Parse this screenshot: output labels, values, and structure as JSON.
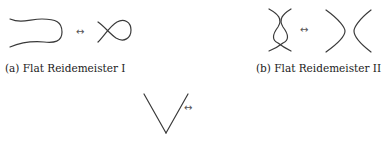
{
  "figure": {
    "moves": [
      {
        "id": "a",
        "caption": "(a) Flat Reidemeister I",
        "left_diagram": "hairpin-arc",
        "right_diagram": "single-crossing-loop",
        "equivalence_symbol": "↔"
      },
      {
        "id": "b",
        "caption": "(b) Flat Reidemeister II",
        "left_diagram": "double-crossing-bigon",
        "right_diagram": "two-separated-arcs",
        "equivalence_symbol": "↔"
      },
      {
        "id": "c",
        "caption": "",
        "left_diagram": "triangle-crossing-arc-above",
        "right_diagram": "triangle-crossing-arc-below",
        "equivalence_symbol": "↔"
      }
    ],
    "stroke_color": "#3a3a3a",
    "background": "#ffffff"
  }
}
